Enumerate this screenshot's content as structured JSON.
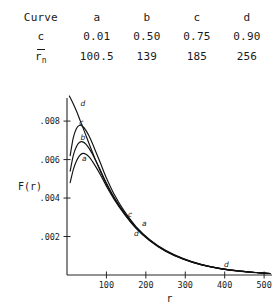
{
  "table": {
    "rows": [
      {
        "label": "Curve",
        "label_kind": "text",
        "values": [
          "a",
          "b",
          "c",
          "d"
        ]
      },
      {
        "label": "c",
        "label_kind": "text",
        "values": [
          "0.01",
          "0.50",
          "0.75",
          "0.90"
        ]
      },
      {
        "label": "r_n_bar",
        "label_kind": "rbar",
        "rbar_symbol": "r",
        "rbar_subscript": "n",
        "values": [
          "100.5",
          "139",
          "185",
          "256"
        ]
      }
    ]
  },
  "chart_data": {
    "type": "line",
    "title": "",
    "xlabel": "r",
    "ylabel": "F(r)",
    "xlim": [
      0,
      520
    ],
    "ylim": [
      0,
      0.0092
    ],
    "xticks": [
      100,
      200,
      300,
      400,
      500
    ],
    "xticklabels": [
      "100",
      "200",
      "300",
      "400",
      "500"
    ],
    "yticks": [
      0.002,
      0.004,
      0.006,
      0.008
    ],
    "yticklabels": [
      ".002",
      ".004",
      ".006",
      ".008"
    ],
    "grid": false,
    "legend": "inline-curve-labels",
    "series": [
      {
        "name": "a",
        "c": 0.01,
        "r_n_bar": 100.5,
        "label_points": [
          {
            "text": "a",
            "x": 44,
            "y": 0.00592
          },
          {
            "text": "a",
            "x": 196,
            "y": 0.00255
          }
        ],
        "x": [
          8,
          16,
          24,
          32,
          40,
          48,
          56,
          64,
          72,
          84,
          100,
          120,
          145,
          175,
          210,
          250,
          295,
          340,
          390,
          440,
          480,
          515
        ],
        "y": [
          0.0048,
          0.00548,
          0.00592,
          0.0062,
          0.00632,
          0.00628,
          0.00614,
          0.00592,
          0.00566,
          0.00524,
          0.00462,
          0.00392,
          0.00318,
          0.00243,
          0.00178,
          0.00124,
          0.00082,
          0.00053,
          0.00032,
          0.00019,
          0.00012,
          8e-05
        ]
      },
      {
        "name": "b",
        "c": 0.5,
        "r_n_bar": 139,
        "label_points": [
          {
            "text": "b",
            "x": 40,
            "y": 0.007
          }
        ],
        "x": [
          8,
          16,
          24,
          32,
          40,
          48,
          56,
          64,
          72,
          84,
          100,
          120,
          145,
          175,
          210,
          250,
          295,
          340,
          390,
          440,
          480,
          515
        ],
        "y": [
          0.0054,
          0.00622,
          0.00668,
          0.0069,
          0.00692,
          0.0068,
          0.00658,
          0.0063,
          0.00598,
          0.00548,
          0.00478,
          0.00402,
          0.00324,
          0.00247,
          0.00181,
          0.00126,
          0.00084,
          0.00054,
          0.00033,
          0.0002,
          0.00013,
          8e-05
        ]
      },
      {
        "name": "c",
        "c": 0.75,
        "r_n_bar": 185,
        "label_points": [
          {
            "text": "c",
            "x": 36,
            "y": 0.00782
          },
          {
            "text": "c",
            "x": 160,
            "y": 0.003
          }
        ],
        "x": [
          8,
          16,
          24,
          32,
          40,
          48,
          56,
          64,
          72,
          84,
          100,
          120,
          145,
          175,
          210,
          250,
          295,
          340,
          390,
          440,
          480,
          515
        ],
        "y": [
          0.0062,
          0.00714,
          0.00762,
          0.00778,
          0.00772,
          0.00752,
          0.00722,
          0.00686,
          0.00646,
          0.00586,
          0.00504,
          0.00418,
          0.00333,
          0.00252,
          0.00184,
          0.00128,
          0.00085,
          0.00055,
          0.00033,
          0.0002,
          0.00013,
          8e-05
        ]
      },
      {
        "name": "d",
        "c": 0.9,
        "r_n_bar": 256,
        "label_points": [
          {
            "text": "d",
            "x": 40,
            "y": 0.0088
          },
          {
            "text": "d",
            "x": 176,
            "y": 0.00205
          },
          {
            "text": "d",
            "x": 404,
            "y": 0.00044
          }
        ],
        "x": [
          6,
          14,
          24,
          34,
          46,
          58,
          70,
          84,
          100,
          120,
          145,
          175,
          210,
          250,
          295,
          340,
          390,
          440,
          480,
          515
        ],
        "y": [
          0.0093,
          0.00898,
          0.00852,
          0.008,
          0.00736,
          0.00672,
          0.0061,
          0.00542,
          0.00472,
          0.00398,
          0.00322,
          0.00246,
          0.0018,
          0.00125,
          0.00083,
          0.00054,
          0.00033,
          0.0002,
          0.00013,
          8e-05
        ]
      }
    ]
  }
}
